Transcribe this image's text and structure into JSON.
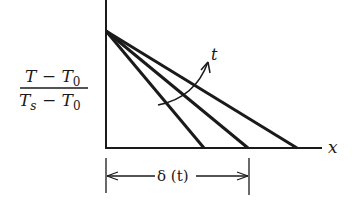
{
  "figure": {
    "y_label": {
      "numerator": {
        "main": "T − T",
        "subscript": "0"
      },
      "denominator": {
        "T": "T",
        "s": "s",
        "rest": " − T",
        "subscript": "0"
      }
    },
    "x_axis_label": "x",
    "parameter_arrow_label": "t",
    "dimension_label": "δ (t)",
    "profiles": [
      {
        "start": [
          106,
          31
        ],
        "end": [
          204,
          148
        ]
      },
      {
        "start": [
          106,
          31
        ],
        "end": [
          248,
          148
        ]
      },
      {
        "start": [
          106,
          31
        ],
        "end": [
          297,
          148
        ]
      }
    ],
    "colors": {
      "ink": "#1a1a1a",
      "background": "#ffffff"
    }
  }
}
